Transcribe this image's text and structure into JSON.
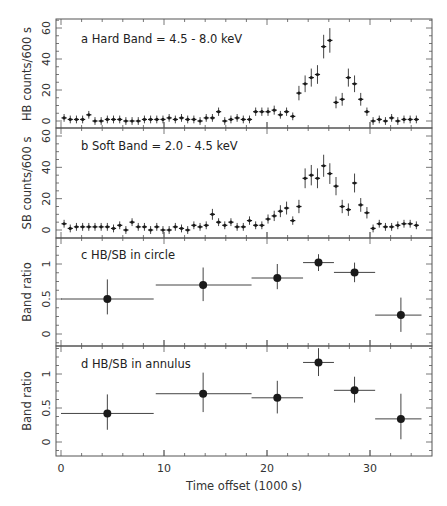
{
  "chart_data": [
    {
      "id": "a",
      "type": "scatter",
      "title": "a  Hard Band = 4.5 - 8.0 keV",
      "xlabel": "Time offset (1000 s)",
      "ylabel": "HB counts/600 s",
      "xlim": [
        -0.5,
        35.5
      ],
      "ylim": [
        -3,
        65
      ],
      "yticks": [
        0,
        20,
        40,
        60
      ],
      "bin_width": 0.6,
      "x_start": 0.3,
      "values": [
        2,
        1,
        1,
        1,
        4,
        0,
        0,
        1,
        1,
        1,
        0,
        0,
        0,
        1,
        1,
        1,
        1,
        2,
        1,
        2,
        1,
        1,
        0,
        2,
        2,
        6,
        0,
        1,
        2,
        1,
        1,
        6,
        6,
        6,
        7,
        4,
        6,
        3,
        18,
        24,
        28,
        30,
        48,
        52,
        12,
        14,
        28,
        24,
        14,
        6,
        0,
        1,
        0,
        2,
        0,
        1,
        1,
        1
      ]
    },
    {
      "id": "b",
      "type": "scatter",
      "title": "b Soft Band = 2.0 - 4.5 keV",
      "xlabel": "Time offset (1000 s)",
      "ylabel": "SB counts/600 s",
      "xlim": [
        -0.5,
        35.5
      ],
      "ylim": [
        -5,
        63
      ],
      "yticks": [
        0,
        20,
        40,
        60
      ],
      "bin_width": 0.6,
      "x_start": 0.3,
      "values": [
        4,
        1,
        2,
        2,
        2,
        2,
        2,
        2,
        1,
        3,
        0,
        5,
        2,
        2,
        0,
        2,
        0,
        0,
        2,
        1,
        0,
        3,
        2,
        3,
        10,
        5,
        3,
        5,
        2,
        2,
        6,
        3,
        3,
        7,
        9,
        12,
        14,
        6,
        15,
        33,
        35,
        33,
        41,
        36,
        28,
        15,
        13,
        30,
        16,
        11,
        1,
        4,
        2,
        2,
        3,
        4,
        4,
        3
      ]
    },
    {
      "id": "c",
      "type": "scatter",
      "title": "c HB/SB in circle",
      "xlabel": "Time offset (1000 s)",
      "ylabel": "Band ratio",
      "xlim": [
        -0.5,
        35.5
      ],
      "ylim": [
        -0.18,
        1.42
      ],
      "yticks": [
        0,
        0.5,
        1
      ],
      "points": [
        {
          "x": 4.5,
          "xlo": 0,
          "xhi": 9,
          "y": 0.5,
          "ylo": 0.28,
          "yhi": 0.78
        },
        {
          "x": 13.8,
          "xlo": 9.2,
          "xhi": 18.5,
          "y": 0.7,
          "ylo": 0.47,
          "yhi": 0.95
        },
        {
          "x": 21,
          "xlo": 18.5,
          "xhi": 23.5,
          "y": 0.8,
          "ylo": 0.64,
          "yhi": 1.0
        },
        {
          "x": 25,
          "xlo": 23.5,
          "xhi": 26.5,
          "y": 1.02,
          "ylo": 0.9,
          "yhi": 1.14
        },
        {
          "x": 28.5,
          "xlo": 26.5,
          "xhi": 30.5,
          "y": 0.88,
          "ylo": 0.74,
          "yhi": 1.02
        },
        {
          "x": 33,
          "xlo": 30.5,
          "xhi": 35,
          "y": 0.27,
          "ylo": 0.03,
          "yhi": 0.52
        }
      ]
    },
    {
      "id": "d",
      "type": "scatter",
      "title": "d HB/SB in annulus",
      "xlabel": "Time offset (1000 s)",
      "ylabel": "Band ratio",
      "xlim": [
        -0.5,
        35.5
      ],
      "ylim": [
        -0.2,
        1.4
      ],
      "yticks": [
        0,
        0.5,
        1
      ],
      "xticks": [
        0,
        10,
        20,
        30
      ],
      "points": [
        {
          "x": 4.5,
          "xlo": 0,
          "xhi": 9,
          "y": 0.42,
          "ylo": 0.18,
          "yhi": 0.7
        },
        {
          "x": 13.8,
          "xlo": 9.2,
          "xhi": 18.5,
          "y": 0.71,
          "ylo": 0.44,
          "yhi": 1.02
        },
        {
          "x": 21,
          "xlo": 18.5,
          "xhi": 23.5,
          "y": 0.65,
          "ylo": 0.42,
          "yhi": 0.9
        },
        {
          "x": 25,
          "xlo": 23.5,
          "xhi": 26.5,
          "y": 1.17,
          "ylo": 0.97,
          "yhi": 1.38
        },
        {
          "x": 28.5,
          "xlo": 26.5,
          "xhi": 30.5,
          "y": 0.76,
          "ylo": 0.58,
          "yhi": 0.96
        },
        {
          "x": 33,
          "xlo": 30.5,
          "xhi": 35,
          "y": 0.34,
          "ylo": 0.04,
          "yhi": 0.71
        }
      ]
    }
  ],
  "labels": {
    "panel_a": "a  Hard Band = 4.5 - 8.0 keV",
    "panel_b": "b Soft Band = 2.0 - 4.5 keV",
    "panel_c": "c HB/SB in circle",
    "panel_d": "d HB/SB in annulus",
    "ylabel_a": "HB counts/600 s",
    "ylabel_b": "SB counts/600 s",
    "ylabel_c": "Band ratio",
    "ylabel_d": "Band ratio",
    "xlabel": "Time offset (1000 s)"
  },
  "colors": {
    "ink": "#1a1a1a",
    "frame": "#555555",
    "err": "#444444"
  }
}
